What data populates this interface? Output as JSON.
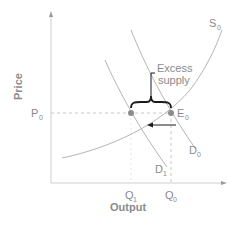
{
  "axes": {
    "y_label": "Price",
    "x_label": "Output"
  },
  "curves": {
    "supply": {
      "label": "S",
      "sub": "0"
    },
    "demand0": {
      "label": "D",
      "sub": "0"
    },
    "demand1": {
      "label": "D",
      "sub": "1"
    }
  },
  "points": {
    "equilibrium": {
      "label": "E",
      "sub": "0"
    }
  },
  "ticks": {
    "price": {
      "label": "P",
      "sub": "0"
    },
    "q1": {
      "label": "Q",
      "sub": "1"
    },
    "q0": {
      "label": "Q",
      "sub": "0"
    }
  },
  "annotation": {
    "line1": "Excess",
    "line2": "supply"
  },
  "colors": {
    "axis": "#c8c8c8",
    "curve": "#b0b0b0",
    "text": "#8a8a8a",
    "dot": "#8c8c8c",
    "bracket": "#1a1a1a"
  }
}
